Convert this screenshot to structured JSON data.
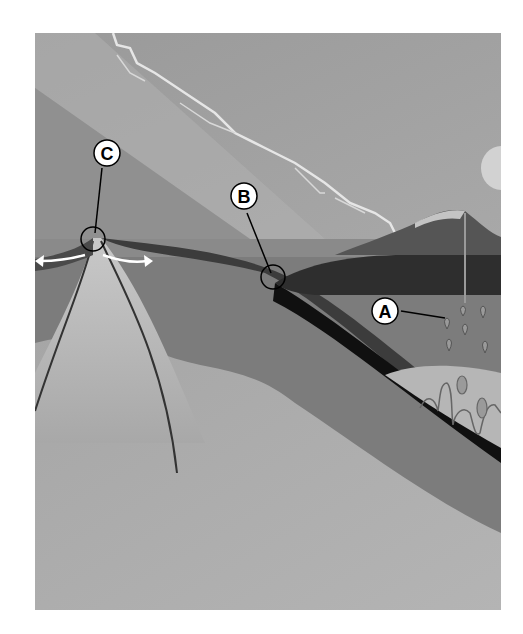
{
  "diagram": {
    "type": "plate-tectonics-cross-section",
    "labels": [
      {
        "id": "A",
        "text": "A",
        "target": "magma-rising-from-subduction-zone"
      },
      {
        "id": "B",
        "text": "B",
        "target": "subduction-zone-trench"
      },
      {
        "id": "C",
        "text": "C",
        "target": "mid-ocean-ridge-divergent-boundary"
      }
    ],
    "colors": {
      "sky": "#a4a4a4",
      "ocean": "#8a8a8a",
      "oceanic_crust": "#4a4a4a",
      "slab": "#111111",
      "upper_mantle": "#7c7c7c",
      "lower_mantle": "#b0b0b0",
      "mountain": "#545454",
      "magma": "#9a9a9a",
      "label_bg": "#ffffff",
      "label_stroke": "#000000"
    }
  }
}
